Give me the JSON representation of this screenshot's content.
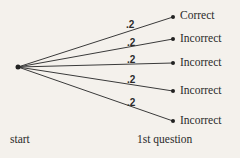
{
  "diagram": {
    "type": "probability-tree",
    "start": {
      "label": "start",
      "x": 18,
      "y": 67
    },
    "stage_label": "1st question",
    "branches": [
      {
        "probability": ".2",
        "outcome": "Correct",
        "end_y": 17
      },
      {
        "probability": ".2",
        "outcome": "Incorrect",
        "end_y": 39
      },
      {
        "probability": ".2",
        "outcome": "Incorrect",
        "end_y": 63
      },
      {
        "probability": ".2",
        "outcome": "Incorrect",
        "end_y": 91
      },
      {
        "probability": ".2",
        "outcome": "Incorrect",
        "end_y": 121
      }
    ]
  }
}
